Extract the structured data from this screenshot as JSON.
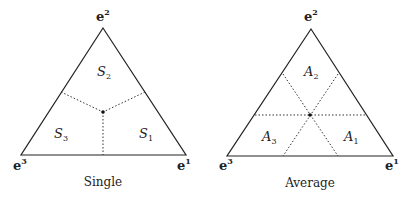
{
  "figures": [
    {
      "caption": "Single",
      "vertices": {
        "top": {
          "base": "e",
          "sup": "2"
        },
        "bottom_left": {
          "base": "e",
          "sup": "3"
        },
        "bottom_right": {
          "base": "e",
          "sup": "1"
        }
      },
      "regions": [
        {
          "base": "S",
          "sub": "2",
          "position": "top"
        },
        {
          "base": "S",
          "sub": "3",
          "position": "bottom-left"
        },
        {
          "base": "S",
          "sub": "1",
          "position": "bottom-right"
        }
      ]
    },
    {
      "caption": "Average",
      "vertices": {
        "top": {
          "base": "e",
          "sup": "2"
        },
        "bottom_left": {
          "base": "e",
          "sup": "3"
        },
        "bottom_right": {
          "base": "e",
          "sup": "1"
        }
      },
      "regions": [
        {
          "base": "A",
          "sub": "2",
          "position": "top"
        },
        {
          "base": "A",
          "sub": "3",
          "position": "bottom-left"
        },
        {
          "base": "A",
          "sub": "1",
          "position": "bottom-right"
        }
      ]
    }
  ],
  "colors": {
    "line": "#222222",
    "dotted": "#333333",
    "background": "#ffffff"
  }
}
